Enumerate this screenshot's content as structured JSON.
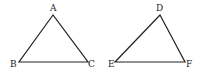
{
  "diagram": {
    "triangles": [
      {
        "name": "ABC",
        "vertices": [
          {
            "label": "A",
            "x": 53,
            "y": 15,
            "lx": 50,
            "ly": 11
          },
          {
            "label": "B",
            "x": 19,
            "y": 62,
            "lx": 10,
            "ly": 67
          },
          {
            "label": "C",
            "x": 88,
            "y": 62,
            "lx": 88,
            "ly": 67
          }
        ]
      },
      {
        "name": "DEF",
        "vertices": [
          {
            "label": "D",
            "x": 160,
            "y": 15,
            "lx": 156,
            "ly": 11
          },
          {
            "label": "E",
            "x": 115,
            "y": 62,
            "lx": 108,
            "ly": 67
          },
          {
            "label": "F",
            "x": 185,
            "y": 62,
            "lx": 186,
            "ly": 67
          }
        ]
      }
    ],
    "stroke_color": "#222222"
  }
}
